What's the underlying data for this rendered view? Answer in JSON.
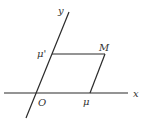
{
  "diagram": {
    "labels": {
      "y_axis": "y",
      "x_axis": "x",
      "origin": "O",
      "point_M": "M",
      "x_projection": "μ",
      "y_projection": "μ'"
    },
    "colors": {
      "line": "#2a2a2a",
      "text": "#333333",
      "background": "#ffffff"
    }
  }
}
